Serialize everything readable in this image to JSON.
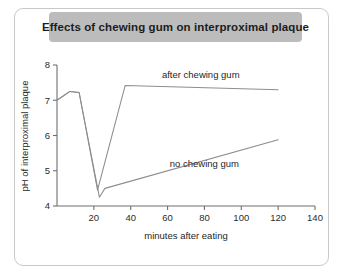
{
  "panel": {
    "title": "Effects of chewing gum on interproximal plaque"
  },
  "chart_data": {
    "type": "line",
    "title": "Effects of chewing gum on interproximal plaque",
    "xlabel": "minutes after eating",
    "ylabel": "pH of interproximal plaque",
    "xlim": [
      0,
      140
    ],
    "ylim": [
      4,
      8
    ],
    "xticks": [
      20,
      40,
      60,
      80,
      100,
      120,
      140
    ],
    "xticklabels": [
      "20",
      "40",
      "60",
      "80",
      "100",
      "120",
      "140"
    ],
    "yticks": [
      4,
      5,
      6,
      7,
      8
    ],
    "yticklabels": [
      "4",
      "5",
      "6",
      "7",
      "8"
    ],
    "grid": false,
    "legend": "inline-annotations",
    "series": [
      {
        "name": "after chewing gum",
        "label_text": "after chewing gum",
        "color": "#8d8d8d",
        "points": [
          {
            "x": 0,
            "y": 7.0
          },
          {
            "x": 7,
            "y": 7.25
          },
          {
            "x": 12,
            "y": 7.22
          },
          {
            "x": 22,
            "y": 4.45
          },
          {
            "x": 37,
            "y": 7.42
          },
          {
            "x": 120,
            "y": 7.3
          }
        ]
      },
      {
        "name": "no chewing gum",
        "label_text": "no chewing gum",
        "color": "#8d8d8d",
        "points": [
          {
            "x": 0,
            "y": 7.0
          },
          {
            "x": 7,
            "y": 7.25
          },
          {
            "x": 12,
            "y": 7.22
          },
          {
            "x": 23,
            "y": 4.25
          },
          {
            "x": 26,
            "y": 4.5
          },
          {
            "x": 120,
            "y": 5.88
          }
        ]
      }
    ],
    "annotations": [
      {
        "text": "after chewing gum",
        "x": 78,
        "y": 7.62
      },
      {
        "text": "no chewing gum",
        "x": 80,
        "y": 5.1
      }
    ]
  }
}
